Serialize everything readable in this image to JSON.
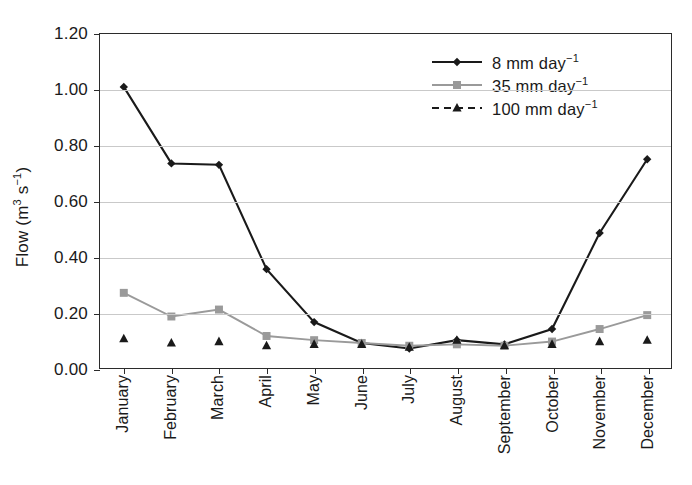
{
  "chart_data": {
    "type": "line",
    "title": "",
    "xlabel": "",
    "ylabel": "Flow (m3 s-1)",
    "ylabel_parts": {
      "prefix": "Flow (m",
      "sup1": "3",
      "mid": " s",
      "sup2": "−1",
      "suffix": ")"
    },
    "ylim": [
      0.0,
      1.2
    ],
    "ytick_values": [
      0.0,
      0.2,
      0.4,
      0.6,
      0.8,
      1.0,
      1.2
    ],
    "ytick_labels": [
      "0.00",
      "0.20",
      "0.40",
      "0.60",
      "0.80",
      "1.00",
      "1.20"
    ],
    "grid": true,
    "grid_axis": "y",
    "legend_position": "top-right",
    "categories": [
      "January",
      "February",
      "March",
      "April",
      "May",
      "June",
      "July",
      "August",
      "September",
      "October",
      "November",
      "December"
    ],
    "series": [
      {
        "name": "8 mm day-1",
        "label_parts": {
          "text": "8 mm day",
          "sup": "−1"
        },
        "color": "#1a1a1a",
        "line_style": "solid",
        "marker": "diamond",
        "values": [
          1.01,
          0.735,
          0.73,
          0.355,
          0.165,
          0.09,
          0.07,
          0.1,
          0.085,
          0.14,
          0.485,
          0.75
        ]
      },
      {
        "name": "35 mm day-1",
        "label_parts": {
          "text": "35 mm day",
          "sup": "−1"
        },
        "color": "#9a9a9a",
        "line_style": "solid",
        "marker": "square",
        "values": [
          0.27,
          0.185,
          0.21,
          0.115,
          0.1,
          0.09,
          0.08,
          0.085,
          0.08,
          0.095,
          0.14,
          0.19
        ]
      },
      {
        "name": "100 mm day-1",
        "label_parts": {
          "text": "100 mm day",
          "sup": "−1"
        },
        "color": "#1a1a1a",
        "line_style": "dashed",
        "marker": "triangle",
        "markers_only": true,
        "values": [
          0.105,
          0.09,
          0.095,
          0.08,
          0.085,
          0.085,
          0.075,
          0.1,
          0.08,
          0.085,
          0.095,
          0.1
        ]
      }
    ]
  }
}
